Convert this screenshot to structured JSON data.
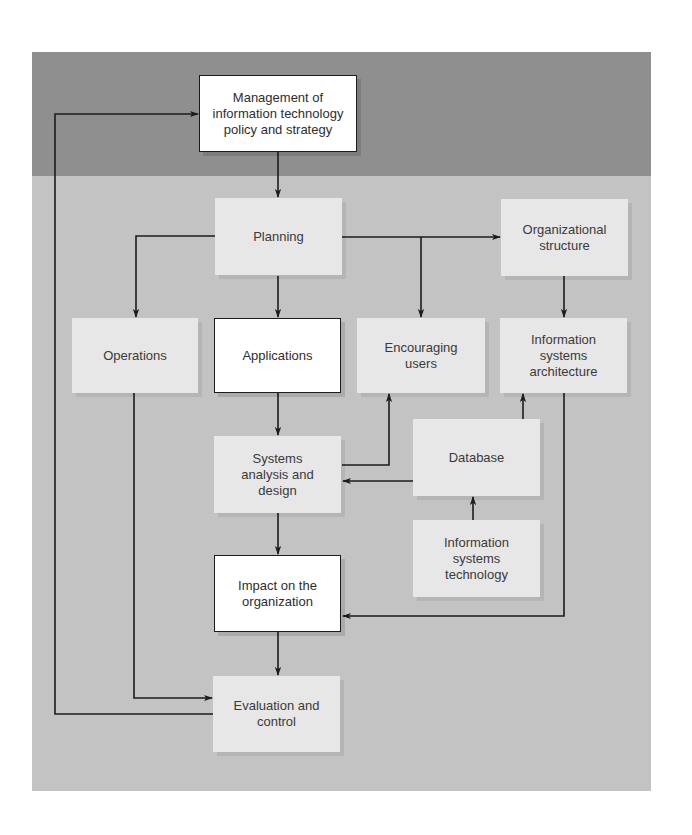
{
  "diagram": {
    "colors": {
      "dark_band": "#8f8f8f",
      "background": "#c3c3c3",
      "light_box": "#e7e7e7",
      "highlight_box": "#ffffff",
      "line": "#1c1c1c"
    },
    "nodes": {
      "management": {
        "label": "Management of\ninformation technology\npolicy and strategy",
        "style": "white"
      },
      "planning": {
        "label": "Planning",
        "style": "light"
      },
      "organizational_structure": {
        "label": "Organizational\nstructure",
        "style": "light"
      },
      "operations": {
        "label": "Operations",
        "style": "light"
      },
      "applications": {
        "label": "Applications",
        "style": "white"
      },
      "encouraging_users": {
        "label": "Encouraging\nusers",
        "style": "light"
      },
      "is_architecture": {
        "label": "Information\nsystems\narchitecture",
        "style": "light"
      },
      "systems_analysis": {
        "label": "Systems\nanalysis and\ndesign",
        "style": "light"
      },
      "database": {
        "label": "Database",
        "style": "light"
      },
      "is_technology": {
        "label": "Information\nsystems\ntechnology",
        "style": "light"
      },
      "impact": {
        "label": "Impact on the\norganization",
        "style": "white"
      },
      "evaluation": {
        "label": "Evaluation and\ncontrol",
        "style": "light"
      }
    },
    "edges": [
      {
        "from": "management",
        "to": "planning"
      },
      {
        "from": "planning",
        "to": "operations"
      },
      {
        "from": "planning",
        "to": "applications"
      },
      {
        "from": "planning",
        "to": "encouraging_users"
      },
      {
        "from": "planning",
        "to": "organizational_structure"
      },
      {
        "from": "organizational_structure",
        "to": "is_architecture"
      },
      {
        "from": "applications",
        "to": "systems_analysis"
      },
      {
        "from": "systems_analysis",
        "to": "encouraging_users"
      },
      {
        "from": "database",
        "to": "systems_analysis"
      },
      {
        "from": "database",
        "to": "is_architecture"
      },
      {
        "from": "is_technology",
        "to": "database"
      },
      {
        "from": "systems_analysis",
        "to": "impact"
      },
      {
        "from": "is_architecture",
        "to": "impact"
      },
      {
        "from": "impact",
        "to": "evaluation"
      },
      {
        "from": "operations",
        "to": "evaluation"
      },
      {
        "from": "evaluation",
        "to": "management"
      }
    ]
  }
}
